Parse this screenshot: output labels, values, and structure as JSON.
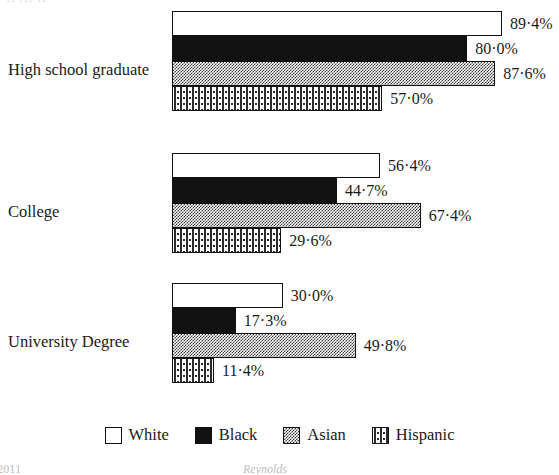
{
  "page": {
    "header_cropped_text": "··  ···            ··",
    "footer_left_cropped_text": "/2011",
    "footer_center_cropped_text": "Reynolds"
  },
  "legend": {
    "items": [
      {
        "label": "White",
        "pattern": "open",
        "swatch_name": "legend-swatch-white"
      },
      {
        "label": "Black",
        "pattern": "solid-black",
        "swatch_name": "legend-swatch-black"
      },
      {
        "label": "Asian",
        "pattern": "checker-grey",
        "swatch_name": "legend-swatch-asian"
      },
      {
        "label": "Hispanic",
        "pattern": "dotted",
        "swatch_name": "legend-swatch-hispanic"
      }
    ]
  },
  "chart_data": {
    "type": "bar",
    "orientation": "horizontal",
    "title": "",
    "subtitle": "",
    "xlabel": "",
    "ylabel": "",
    "xlim": [
      0,
      100
    ],
    "grid": false,
    "legend_position": "bottom",
    "value_suffix": "%",
    "decimal_separator": "·",
    "categories": [
      "High school graduate",
      "College",
      "University Degree"
    ],
    "series": [
      {
        "name": "White",
        "values": [
          89.4,
          56.4,
          30.0
        ],
        "labels": [
          "89·4%",
          "56·4%",
          "30·0%"
        ]
      },
      {
        "name": "Black",
        "values": [
          80.0,
          44.7,
          17.3
        ],
        "labels": [
          "80·0%",
          "44·7%",
          "17·3%"
        ]
      },
      {
        "name": "Asian",
        "values": [
          87.6,
          67.4,
          49.8
        ],
        "labels": [
          "87·6%",
          "67·4%",
          "49·8%"
        ]
      },
      {
        "name": "Hispanic",
        "values": [
          57.0,
          29.6,
          11.4
        ],
        "labels": [
          "57·0%",
          "29·6%",
          "11·4%"
        ]
      }
    ],
    "groups": [
      {
        "category": "High school graduate",
        "top": 11,
        "label_top": 62,
        "bars": [
          {
            "series": "White",
            "value": 89.4,
            "label": "89·4%",
            "fill": "open"
          },
          {
            "series": "Black",
            "value": 80.0,
            "label": "80·0%",
            "fill": "solid-black"
          },
          {
            "series": "Asian",
            "value": 87.6,
            "label": "87·6%",
            "fill": "checker-grey"
          },
          {
            "series": "Hispanic",
            "value": 57.0,
            "label": "57·0%",
            "fill": "dotted"
          }
        ]
      },
      {
        "category": "College",
        "top": 153,
        "label_top": 204,
        "bars": [
          {
            "series": "White",
            "value": 56.4,
            "label": "56·4%",
            "fill": "open"
          },
          {
            "series": "Black",
            "value": 44.7,
            "label": "44·7%",
            "fill": "solid-black"
          },
          {
            "series": "Asian",
            "value": 67.4,
            "label": "67·4%",
            "fill": "checker-grey"
          },
          {
            "series": "Hispanic",
            "value": 29.6,
            "label": "29·6%",
            "fill": "dotted"
          }
        ]
      },
      {
        "category": "University Degree",
        "top": 283,
        "label_top": 334,
        "bars": [
          {
            "series": "White",
            "value": 30.0,
            "label": "30·0%",
            "fill": "open"
          },
          {
            "series": "Black",
            "value": 17.3,
            "label": "17·3%",
            "fill": "solid-black"
          },
          {
            "series": "Asian",
            "value": 49.8,
            "label": "49·8%",
            "fill": "checker-grey"
          },
          {
            "series": "Hispanic",
            "value": 11.4,
            "label": "11·4%",
            "fill": "dotted"
          }
        ]
      }
    ]
  },
  "geometry": {
    "bar_origin_x": 172,
    "px_per_percent": 3.69,
    "bar_height": 25,
    "value_gap": 8
  },
  "colors": {
    "ink": "#111111",
    "background": "#ffffff",
    "pattern_grey": "#3a3a3a"
  }
}
